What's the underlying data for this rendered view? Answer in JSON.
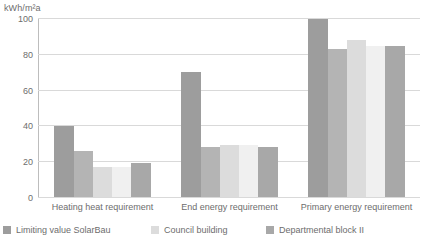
{
  "chart_data": {
    "type": "bar",
    "title": "",
    "subtitle": "",
    "xlabel": "",
    "ylabel": "kWh/m²a",
    "ylim": [
      0,
      100
    ],
    "yticks": [
      0,
      20,
      40,
      60,
      80,
      100
    ],
    "grid": true,
    "legend_position": "bottom",
    "categories": [
      "Heating heat requirement",
      "End energy requirement",
      "Primary energy requirement"
    ],
    "series": [
      {
        "name": "Limiting value SolarBau",
        "color": "#9d9d9d",
        "values": [
          40,
          70,
          100
        ]
      },
      {
        "name": "series-2",
        "color": "#b4b4b4",
        "values": [
          26,
          28,
          83
        ]
      },
      {
        "name": "Council building",
        "color": "#dcdcdc",
        "values": [
          17,
          29,
          88
        ]
      },
      {
        "name": "series-4",
        "color": "#f0f0f0",
        "values": [
          17,
          29,
          85
        ]
      },
      {
        "name": "Departmental block II",
        "color": "#a8a8a8",
        "values": [
          19,
          28,
          85
        ]
      }
    ],
    "legend": [
      {
        "label": "Limiting value SolarBau",
        "color": "#9d9d9d"
      },
      {
        "label": "Council building",
        "color": "#dcdcdc"
      },
      {
        "label": "Departmental block II",
        "color": "#a8a8a8"
      }
    ]
  }
}
